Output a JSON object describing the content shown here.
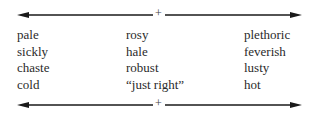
{
  "scale": {
    "top_axis": {
      "center_label": "+"
    },
    "bottom_axis": {
      "center_label": "+"
    },
    "columns": [
      {
        "name": "deficient",
        "items": [
          "pale",
          "sickly",
          "chaste",
          "cold"
        ]
      },
      {
        "name": "balanced",
        "items": [
          "rosy",
          "hale",
          "robust",
          "“just right”"
        ]
      },
      {
        "name": "excess",
        "items": [
          "plethoric",
          "feverish",
          "lusty",
          "hot"
        ]
      }
    ]
  },
  "colors": {
    "line": "#1a1a1a",
    "text": "#2a2a2a"
  }
}
